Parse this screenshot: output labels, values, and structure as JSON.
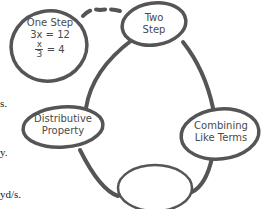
{
  "diagram": {
    "nodes": [
      {
        "id": "one-step",
        "title": "One Step",
        "lines": [
          "3x = 12"
        ],
        "fraction": {
          "num": "x",
          "den": "3",
          "rhs": "= 4"
        }
      },
      {
        "id": "two-step",
        "title": "Two",
        "title2": "Step"
      },
      {
        "id": "distributive",
        "title": "Distributive",
        "title2": "Property"
      },
      {
        "id": "combining",
        "title": "Combining",
        "title2": "Like Terms"
      },
      {
        "id": "blank",
        "title": ""
      }
    ],
    "edges": [
      {
        "from": "one-step",
        "to": "two-step",
        "style": "dashed"
      },
      {
        "from": "two-step",
        "to": "combining",
        "style": "solid"
      },
      {
        "from": "combining",
        "to": "blank",
        "style": "solid"
      },
      {
        "from": "blank",
        "to": "distributive",
        "style": "solid"
      },
      {
        "from": "distributive",
        "to": "two-step",
        "style": "solid"
      }
    ],
    "stroke_color": "#555555"
  },
  "left_fragments": [
    "s.",
    "y.",
    "yd/s."
  ]
}
